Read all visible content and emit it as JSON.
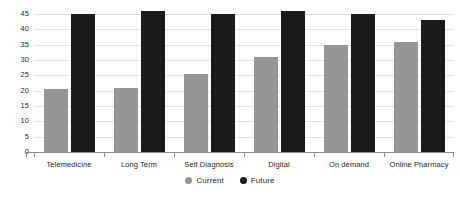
{
  "chart_data": {
    "type": "bar",
    "title": "",
    "subtitle": "",
    "xlabel": "",
    "ylabel": "",
    "categories": [
      "Telemedicine",
      "Long Term",
      "Self Diagnosis",
      "Digital",
      "On demand",
      "Online Pharmacy"
    ],
    "series": [
      {
        "name": "Current",
        "color": "#969696",
        "values": [
          20.5,
          21,
          25.5,
          31,
          35,
          36
        ]
      },
      {
        "name": "Future",
        "color": "#1a1a1a",
        "values": [
          45,
          46,
          45,
          46,
          45,
          43
        ]
      }
    ],
    "ylim": [
      0,
      45
    ],
    "ytick_step": 5,
    "yticks": [
      "45",
      "40",
      "35",
      "30",
      "25",
      "20",
      "15",
      "10",
      "5",
      "0"
    ],
    "ytick_values": [
      45,
      40,
      35,
      30,
      25,
      20,
      15,
      10,
      5,
      0
    ],
    "grid": true,
    "grid_color": "#e3e3e3",
    "legend_position": "bottom-center",
    "legend": [
      {
        "label": "Current",
        "color": "#969696"
      },
      {
        "label": "Future",
        "color": "#1a1a1a"
      }
    ],
    "background": "#ffffff",
    "axis_color": "#8d8d8d"
  }
}
